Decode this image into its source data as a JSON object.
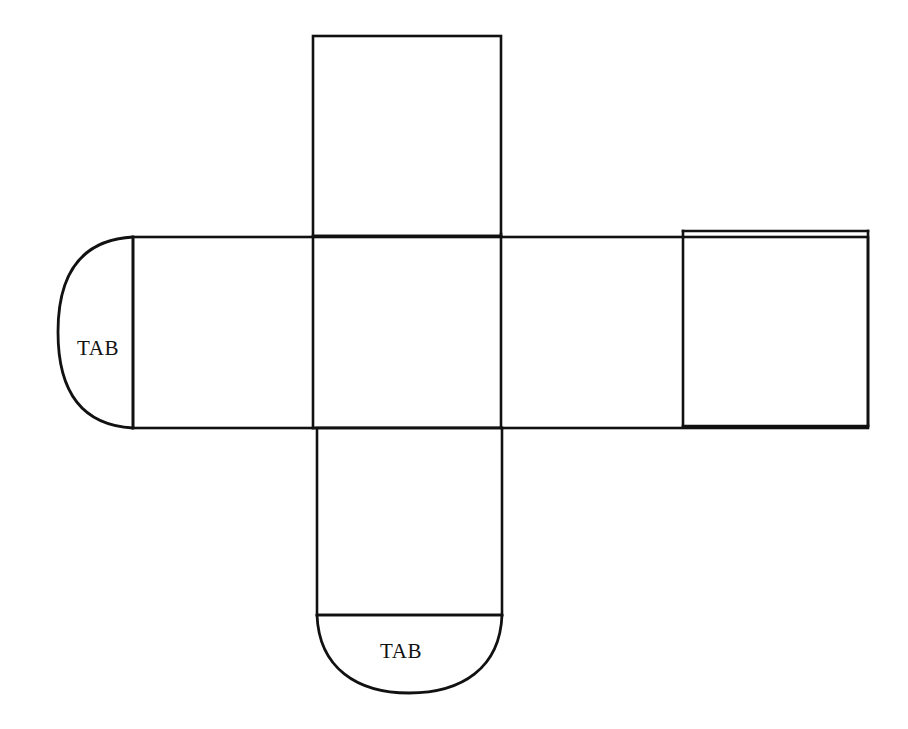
{
  "figure": {
    "kind": "cube-net-diagram",
    "background_color": "#ffffff",
    "line_color": "#111111",
    "title": ""
  },
  "labels": {
    "tab_left": "TAB",
    "tab_bottom": "TAB"
  },
  "geometry": {
    "canvas": {
      "width": 908,
      "height": 729
    },
    "faces": [
      {
        "name": "top-face",
        "x": 313,
        "y": 36,
        "width": 188,
        "height": 200
      },
      {
        "name": "left-face",
        "x": 133,
        "y": 237,
        "width": 180,
        "height": 191
      },
      {
        "name": "center-face",
        "x": 313,
        "y": 237,
        "width": 188,
        "height": 191
      },
      {
        "name": "right-face",
        "x": 501,
        "y": 234,
        "width": 182,
        "height": 193
      },
      {
        "name": "far-right-face",
        "x": 683,
        "y": 231,
        "width": 185,
        "height": 195
      },
      {
        "name": "bottom-face",
        "x": 317,
        "y": 428,
        "width": 185,
        "height": 187
      }
    ],
    "tabs": [
      {
        "name": "tab-left",
        "side": "left",
        "anchor_x": 133,
        "y_top": 237,
        "y_bottom": 428,
        "depth": 75
      },
      {
        "name": "tab-bottom",
        "side": "bottom",
        "anchor_y": 615,
        "x_left": 317,
        "x_right": 502,
        "depth": 78
      }
    ]
  }
}
